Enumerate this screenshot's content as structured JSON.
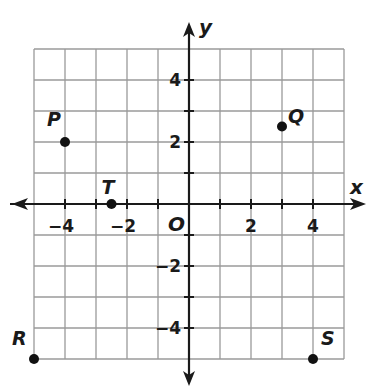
{
  "chart_data": {
    "type": "scatter",
    "title": "",
    "xlabel": "x",
    "ylabel": "y",
    "origin_label": "O",
    "xlim": [
      -5,
      5
    ],
    "ylim": [
      -5,
      5
    ],
    "grid": true,
    "grid_step": 1,
    "x_tick_labels": [
      {
        "value": -4,
        "label": "−4"
      },
      {
        "value": -2,
        "label": "−2"
      },
      {
        "value": 2,
        "label": "2"
      },
      {
        "value": 4,
        "label": "4"
      }
    ],
    "y_tick_labels": [
      {
        "value": 4,
        "label": "4"
      },
      {
        "value": 2,
        "label": "2"
      },
      {
        "value": -2,
        "label": "−2"
      },
      {
        "value": -4,
        "label": "−4"
      }
    ],
    "points": [
      {
        "name": "P",
        "x": -4,
        "y": 2
      },
      {
        "name": "Q",
        "x": 3,
        "y": 2.5
      },
      {
        "name": "T",
        "x": -2.5,
        "y": 0
      },
      {
        "name": "R",
        "x": -5,
        "y": -5
      },
      {
        "name": "S",
        "x": 4,
        "y": -5
      }
    ]
  },
  "colors": {
    "grid": "#9a9a9a",
    "axis": "#1a1a1a",
    "point": "#111111",
    "text": "#1a1a1a"
  }
}
